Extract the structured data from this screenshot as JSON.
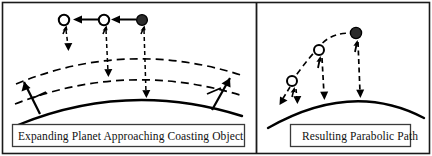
{
  "figure": {
    "width": 432,
    "height": 156,
    "background_color": "#ffffff",
    "ink_color": "#000000",
    "border": "thin black rectangle around entire figure",
    "divider": "vertical black line separating the two panels"
  },
  "panels": [
    {
      "id": "left-panel",
      "caption": "Expanding Planet Approaching Coasting Object",
      "description": "Expanding planet surface shown as three nested arcs (solid outer-current surface and two dashed expanded positions) with three object positions above, connected by leftward arrows, and vertical dashed gap arrows.",
      "objects": [
        {
          "name": "object-position-1",
          "fill": "hollow",
          "cx": 64,
          "cy": 20
        },
        {
          "name": "object-position-2",
          "fill": "hollow",
          "cx": 104,
          "cy": 20
        },
        {
          "name": "object-position-3",
          "fill": "filled",
          "cx": 142,
          "cy": 20
        }
      ],
      "motion_arrows": [
        {
          "name": "motion-arrow-right-to-middle",
          "from_x": 136,
          "to_x": 112,
          "y": 20
        },
        {
          "name": "motion-arrow-middle-to-left",
          "from_x": 98,
          "to_x": 74,
          "y": 20
        }
      ],
      "gap_arrows": [
        {
          "name": "gap-arrow-1",
          "x": 66,
          "top": 27,
          "bottom": 50
        },
        {
          "name": "gap-arrow-2",
          "x": 106,
          "top": 27,
          "bottom": 76
        },
        {
          "name": "gap-arrow-3",
          "x": 144,
          "top": 27,
          "bottom": 97
        }
      ],
      "surface_arcs": [
        {
          "name": "surface-arc-outer-dashed",
          "style": "dashed"
        },
        {
          "name": "surface-arc-middle-dashed",
          "style": "dashed"
        },
        {
          "name": "surface-arc-solid-current",
          "style": "solid"
        }
      ],
      "expansion_arrows": [
        {
          "name": "expansion-arrow-left",
          "direction": "outward-up-left"
        },
        {
          "name": "expansion-arrow-right",
          "direction": "outward-up-right"
        }
      ]
    },
    {
      "id": "right-panel",
      "caption": "Resulting Parabolic Path",
      "description": "A dashed parabolic trajectory over a solid curved planet surface, with three object positions and vertical dashed height arrows down to the surface.",
      "objects": [
        {
          "name": "object-position-1",
          "fill": "hollow",
          "cx": 293,
          "cy": 81
        },
        {
          "name": "object-position-2",
          "fill": "hollow",
          "cx": 320,
          "cy": 50
        },
        {
          "name": "object-position-3",
          "fill": "filled",
          "cx": 356,
          "cy": 34
        }
      ],
      "trajectory": {
        "name": "parabolic-trajectory",
        "style": "dashed"
      },
      "exit_arrow": {
        "name": "trajectory-exit-arrow",
        "direction": "down-left"
      },
      "height_arrows": [
        {
          "name": "height-arrow-1",
          "x": 295,
          "top": 88,
          "bottom": 104
        },
        {
          "name": "height-arrow-2",
          "x": 322,
          "top": 58,
          "bottom": 100
        },
        {
          "name": "height-arrow-3",
          "x": 358,
          "top": 42,
          "bottom": 98
        }
      ],
      "surface_arc": {
        "name": "planet-surface-arc",
        "style": "solid"
      }
    }
  ]
}
